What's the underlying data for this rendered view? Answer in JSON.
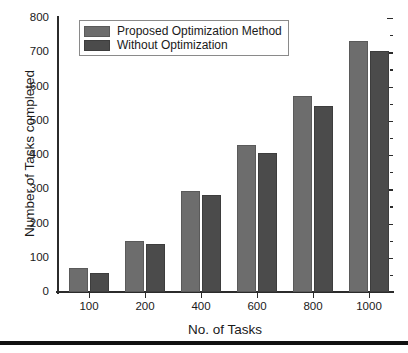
{
  "chart_data": {
    "type": "bar",
    "title": "",
    "xlabel": "No. of Tasks",
    "ylabel": "Number of Tasks completed",
    "categories": [
      "100",
      "200",
      "400",
      "600",
      "800",
      "1000"
    ],
    "series": [
      {
        "name": "Proposed Optimization Method",
        "color": "#6d6d6d",
        "values": [
          70,
          148,
          296,
          430,
          572,
          732
        ]
      },
      {
        "name": "Without Optimization",
        "color": "#4b4b4b",
        "values": [
          55,
          141,
          282,
          407,
          542,
          703
        ]
      }
    ],
    "ylim": [
      0,
      800
    ],
    "yticks": [
      0,
      100,
      200,
      300,
      400,
      500,
      600,
      700,
      800
    ],
    "ytick_labels": [
      "0",
      "100",
      "200",
      "300",
      "400",
      "500",
      "600",
      "700",
      "800"
    ],
    "grid": false,
    "legend_position": "top-left-inside"
  },
  "legend": {
    "entries": [
      {
        "label": "Proposed Optimization Method"
      },
      {
        "label": "Without Optimization"
      }
    ]
  }
}
